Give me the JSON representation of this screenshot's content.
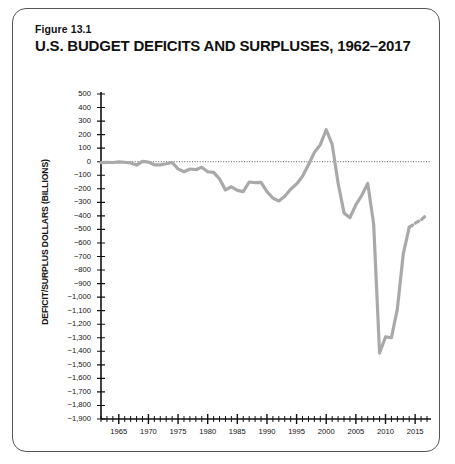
{
  "figure": {
    "number": "Figure 13.1",
    "title": "U.S. BUDGET DEFICITS AND SURPLUSES, 1962–2017"
  },
  "colors": {
    "line": "#a9a9a9",
    "axis": "#111111",
    "zero_line": "#555555",
    "border": "#555555",
    "text": "#111111"
  },
  "chart_data": {
    "type": "line",
    "title": "U.S. BUDGET DEFICITS AND SURPLUSES, 1962–2017",
    "xlabel": "",
    "ylabel": "DEFICIT/SURPLUS DOLLARS (BILLIONS)",
    "xlim": [
      1962,
      2017
    ],
    "ylim": [
      -1900,
      500
    ],
    "ytick_step": 100,
    "xtick_step": 1,
    "xlabel_step": 5,
    "grid": false,
    "legend": false,
    "zero_reference_line": 0,
    "ytick_labels": [
      "500",
      "400",
      "300",
      "200",
      "100",
      "0",
      "−100",
      "−200",
      "−300",
      "−400",
      "−500",
      "−600",
      "−700",
      "−800",
      "−900",
      "−1,000",
      "−1,100",
      "−1,200",
      "−1,300",
      "−1,400",
      "−1,500",
      "−1,600",
      "−1,700",
      "−1,800",
      "−1,900"
    ],
    "ytick_values": [
      500,
      400,
      300,
      200,
      100,
      0,
      -100,
      -200,
      -300,
      -400,
      -500,
      -600,
      -700,
      -800,
      -900,
      -1000,
      -1100,
      -1200,
      -1300,
      -1400,
      -1500,
      -1600,
      -1700,
      -1800,
      -1900
    ],
    "xtick_labels": [
      "1965",
      "1970",
      "1975",
      "1980",
      "1985",
      "1990",
      "1995",
      "2000",
      "2005",
      "2010",
      "2015"
    ],
    "xtick_values": [
      1965,
      1970,
      1975,
      1980,
      1985,
      1990,
      1995,
      2000,
      2005,
      2010,
      2015
    ],
    "series": [
      {
        "name": "Budget surplus/deficit",
        "style": "solid",
        "x": [
          1962,
          1963,
          1964,
          1965,
          1966,
          1967,
          1968,
          1969,
          1970,
          1971,
          1972,
          1973,
          1974,
          1975,
          1976,
          1977,
          1978,
          1979,
          1980,
          1981,
          1982,
          1983,
          1984,
          1985,
          1986,
          1987,
          1988,
          1989,
          1990,
          1991,
          1992,
          1993,
          1994,
          1995,
          1996,
          1997,
          1998,
          1999,
          2000,
          2001,
          2002,
          2003,
          2004,
          2005,
          2006,
          2007,
          2008,
          2009,
          2010,
          2011,
          2012,
          2013,
          2014
        ],
        "values": [
          -7,
          -5,
          -6,
          -1,
          -4,
          -9,
          -25,
          3,
          -3,
          -23,
          -23,
          -15,
          -6,
          -53,
          -74,
          -54,
          -59,
          -41,
          -74,
          -79,
          -128,
          -208,
          -185,
          -212,
          -221,
          -150,
          -155,
          -153,
          -221,
          -269,
          -290,
          -255,
          -203,
          -164,
          -107,
          -22,
          69,
          126,
          236,
          128,
          -158,
          -378,
          -413,
          -318,
          -248,
          -161,
          -459,
          -1413,
          -1294,
          -1300,
          -1087,
          -680,
          -485
        ]
      },
      {
        "name": "Projected",
        "style": "dashed",
        "x": [
          2014,
          2015,
          2016,
          2017
        ],
        "values": [
          -485,
          -455,
          -430,
          -390
        ]
      }
    ],
    "annotations": [
      {
        "text": "Peak surplus near 2000",
        "value": 236,
        "year": 2000
      },
      {
        "text": "Record deficit in 2009",
        "value": -1413,
        "year": 2009
      },
      {
        "text": "Dashed segment indicates projections",
        "year_range": [
          2014,
          2017
        ]
      }
    ]
  }
}
